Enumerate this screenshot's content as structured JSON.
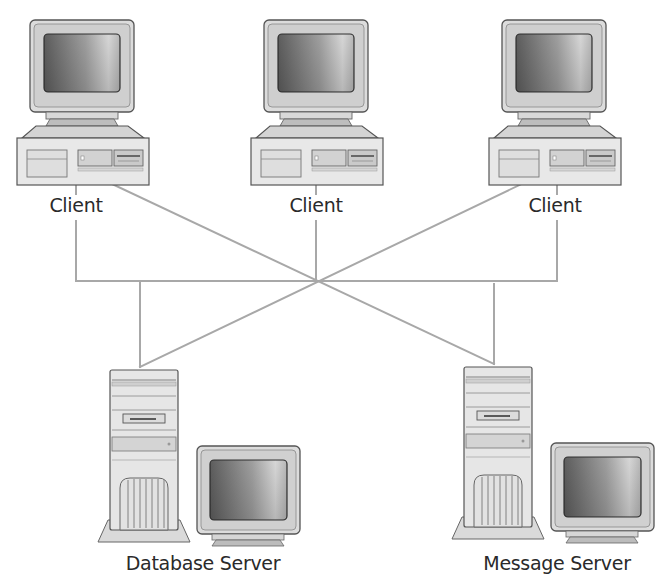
{
  "diagram": {
    "type": "client-server network topology",
    "nodes": [
      {
        "id": "client-1",
        "kind": "desktop-computer",
        "label": "Client"
      },
      {
        "id": "client-2",
        "kind": "desktop-computer",
        "label": "Client"
      },
      {
        "id": "client-3",
        "kind": "desktop-computer",
        "label": "Client"
      },
      {
        "id": "database-server",
        "kind": "tower-server-with-monitor",
        "label": "Database Server"
      },
      {
        "id": "message-server",
        "kind": "tower-server-with-monitor",
        "label": "Message Server"
      }
    ],
    "connections": [
      {
        "from": "client-1",
        "to": "database-server"
      },
      {
        "from": "client-1",
        "to": "message-server"
      },
      {
        "from": "client-2",
        "to": "database-server"
      },
      {
        "from": "client-2",
        "to": "message-server"
      },
      {
        "from": "client-3",
        "to": "database-server"
      },
      {
        "from": "client-3",
        "to": "message-server"
      }
    ],
    "colors": {
      "line": "#a8a8a8",
      "body_fill": "#e6e6e6",
      "outline": "#6e6e6e",
      "text": "#2a2a2a"
    }
  },
  "labels": {
    "client_1": "Client",
    "client_2": "Client",
    "client_3": "Client",
    "database_server": "Database Server",
    "message_server": "Message Server"
  }
}
